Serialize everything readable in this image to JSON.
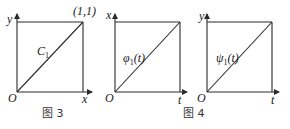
{
  "figures": [
    {
      "id": "fig3",
      "y_axis_label": "y",
      "x_axis_label": "x",
      "origin_label": "O",
      "corner_label": "(1,1)",
      "curve_label": "C",
      "curve_subscript": "1"
    },
    {
      "id": "fig4a",
      "y_axis_label": "x",
      "x_axis_label": "t",
      "origin_label": "O",
      "curve_label": "φ",
      "curve_subscript": "1",
      "curve_arg": "(t)"
    },
    {
      "id": "fig4b",
      "y_axis_label": "y",
      "x_axis_label": "t",
      "origin_label": "O",
      "curve_label": "ψ",
      "curve_subscript": "1",
      "curve_arg": "(t)"
    }
  ],
  "captions": {
    "fig3": "图 3",
    "fig4": "图 4"
  },
  "colors": {
    "line": "#2a2a2a",
    "text": "#1a1a1a"
  }
}
